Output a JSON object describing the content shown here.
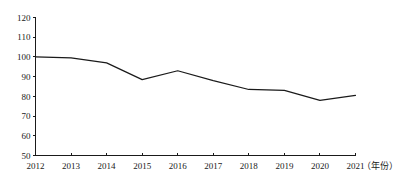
{
  "chart_data": {
    "type": "line",
    "title": "",
    "subtitle": "",
    "xlabel": "（年份）",
    "ylabel": "",
    "categories": [
      "2012",
      "2013",
      "2014",
      "2015",
      "2016",
      "2017",
      "2018",
      "2019",
      "2020",
      "2021"
    ],
    "x": [
      2012,
      2013,
      2014,
      2015,
      2016,
      2017,
      2018,
      2019,
      2020,
      2021
    ],
    "values": [
      100,
      99.5,
      97,
      88.5,
      93,
      88,
      83.5,
      83,
      78,
      80.5
    ],
    "series": [
      {
        "name": "",
        "values": [
          100,
          99.5,
          97,
          88.5,
          93,
          88,
          83.5,
          83,
          78,
          80.5
        ]
      }
    ],
    "ylim": [
      50,
      120
    ],
    "xlim": [
      2012,
      2021
    ],
    "y_ticks": [
      50,
      60,
      70,
      80,
      90,
      100,
      110,
      120
    ],
    "y_tick_labels": [
      "50",
      "60",
      "70",
      "80",
      "90",
      "100",
      "110",
      "120"
    ],
    "x_ticks": [
      2012,
      2013,
      2014,
      2015,
      2016,
      2017,
      2018,
      2019,
      2020,
      2021
    ],
    "x_tick_labels": [
      "2012",
      "2013",
      "2014",
      "2015",
      "2016",
      "2017",
      "2018",
      "2019",
      "2020",
      "2021"
    ],
    "grid": false,
    "legend": null,
    "legend_position": "none",
    "annotations": [],
    "line_color": "#1a1a1a",
    "axis_color": "#1a1a1a",
    "background_color": "#ffffff"
  }
}
